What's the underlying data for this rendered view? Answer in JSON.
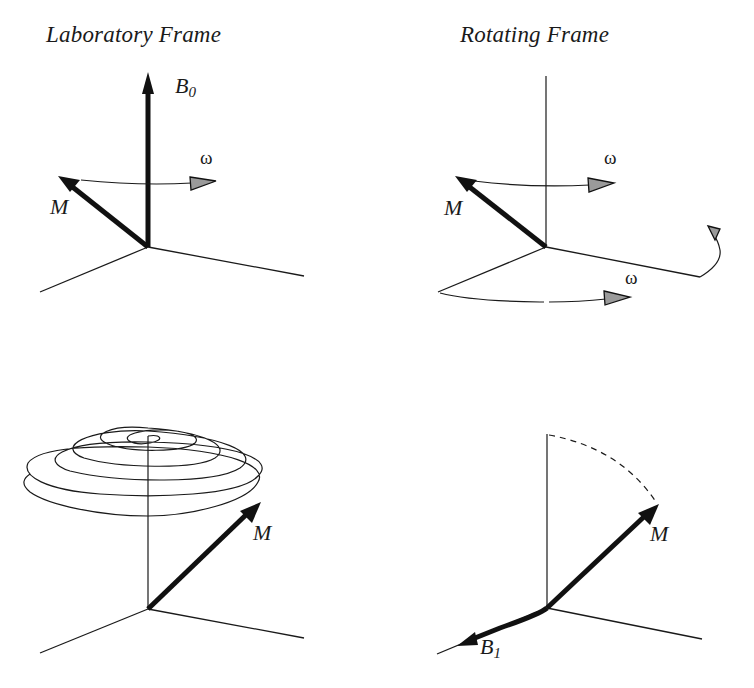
{
  "panels": {
    "lab_frame": {
      "title": "Laboratory Frame",
      "b0_label": "B",
      "b0_sub": "0",
      "m_label": "M",
      "omega_label": "ω"
    },
    "rotating_frame": {
      "title": "Rotating Frame",
      "m_label": "M",
      "omega_top_label": "ω",
      "omega_bottom_label": "ω"
    },
    "lab_spiral": {
      "m_label": "M"
    },
    "rotating_tipped": {
      "m_label": "M",
      "b1_label": "B",
      "b1_sub": "1"
    }
  },
  "colors": {
    "line": "#1a1a1a",
    "arrow_fill": "#9a9a9a",
    "background": "#ffffff"
  }
}
